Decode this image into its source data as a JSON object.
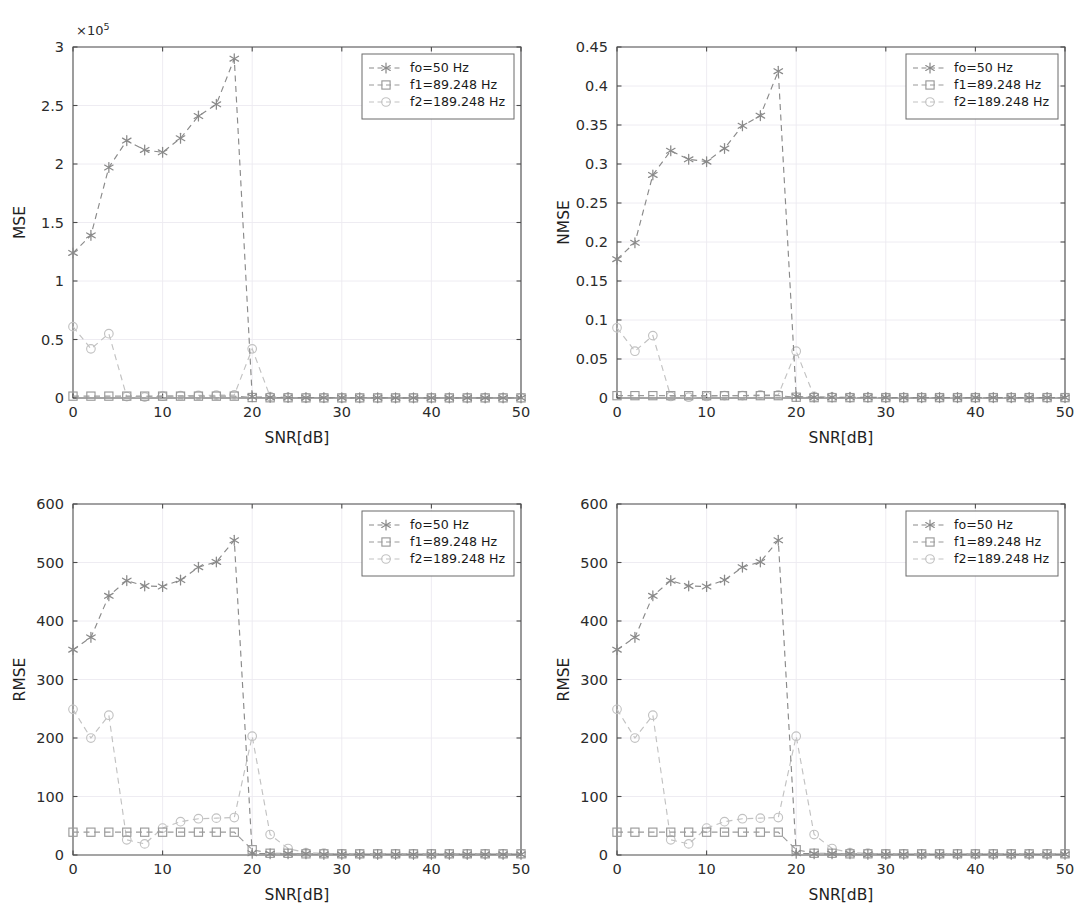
{
  "figure": {
    "background": "#ffffff",
    "xlabel": "SNR[dB]",
    "panel_count": 4
  },
  "legend": {
    "entries": [
      {
        "label": "fo=50 Hz",
        "marker": "star",
        "color": "#8a8a8a"
      },
      {
        "label": "f1=89.248 Hz",
        "marker": "square",
        "color": "#9a9a9a"
      },
      {
        "label": "f2=189.248 Hz",
        "marker": "circle",
        "color": "#c2c2c2"
      }
    ]
  },
  "chart_data": [
    {
      "id": "panel-mse-top-left",
      "type": "line",
      "title": "",
      "xlabel": "SNR[dB]",
      "ylabel": "MSE",
      "xlim": [
        0,
        50
      ],
      "ylim": [
        0,
        3
      ],
      "xticks": [
        0,
        10,
        20,
        30,
        40,
        50
      ],
      "yticks": [
        0,
        0.5,
        1,
        1.5,
        2,
        2.5,
        3
      ],
      "ytick_labels": [
        "0",
        "0.5",
        "1",
        "1.5",
        "2",
        "2.5",
        "3"
      ],
      "y_offset_text": "×10",
      "y_offset_exponent": "5",
      "grid": true,
      "legend_position": "upper right",
      "x": [
        0,
        2,
        4,
        6,
        8,
        10,
        12,
        14,
        16,
        18,
        20,
        22,
        24,
        26,
        28,
        30,
        32,
        34,
        36,
        38,
        40,
        42,
        44,
        46,
        48,
        50
      ],
      "series": [
        {
          "name": "fo=50 Hz",
          "marker": "star",
          "color": "#8a8a8a",
          "values": [
            1.24,
            1.39,
            1.97,
            2.2,
            2.12,
            2.1,
            2.22,
            2.41,
            2.51,
            2.9,
            0.01,
            0.005,
            0.004,
            0.003,
            0.003,
            0.002,
            0.002,
            0.002,
            0.001,
            0.001,
            0.001,
            0.001,
            0.001,
            0.001,
            0.001,
            0.001
          ]
        },
        {
          "name": "f1=89.248 Hz",
          "marker": "square",
          "color": "#9a9a9a",
          "values": [
            0.016,
            0.016,
            0.016,
            0.016,
            0.016,
            0.016,
            0.016,
            0.016,
            0.016,
            0.016,
            0.004,
            0.002,
            0.002,
            0.001,
            0.001,
            0.001,
            0.001,
            0.001,
            0.001,
            0.001,
            0.001,
            0.001,
            0.001,
            0.001,
            0.001,
            0.001
          ]
        },
        {
          "name": "f2=189.248 Hz",
          "marker": "circle",
          "color": "#c2c2c2",
          "values": [
            0.61,
            0.42,
            0.55,
            0.012,
            0.008,
            0.016,
            0.02,
            0.022,
            0.024,
            0.026,
            0.42,
            0.012,
            0.005,
            0.002,
            0.001,
            0.001,
            0.001,
            0.001,
            0.001,
            0.001,
            0.001,
            0.001,
            0.001,
            0.001,
            0.001,
            0.001
          ]
        }
      ]
    },
    {
      "id": "panel-nmse-top-right",
      "type": "line",
      "title": "",
      "xlabel": "SNR[dB]",
      "ylabel": "NMSE",
      "xlim": [
        0,
        50
      ],
      "ylim": [
        0,
        0.45
      ],
      "xticks": [
        0,
        10,
        20,
        30,
        40,
        50
      ],
      "yticks": [
        0,
        0.05,
        0.1,
        0.15,
        0.2,
        0.25,
        0.3,
        0.35,
        0.4,
        0.45
      ],
      "ytick_labels": [
        "0",
        "0.05",
        "0.1",
        "0.15",
        "0.2",
        "0.25",
        "0.3",
        "0.35",
        "0.4",
        "0.45"
      ],
      "y_offset_text": "",
      "y_offset_exponent": "",
      "grid": true,
      "legend_position": "upper right",
      "x": [
        0,
        2,
        4,
        6,
        8,
        10,
        12,
        14,
        16,
        18,
        20,
        22,
        24,
        26,
        28,
        30,
        32,
        34,
        36,
        38,
        40,
        42,
        44,
        46,
        48,
        50
      ],
      "series": [
        {
          "name": "fo=50 Hz",
          "marker": "star",
          "color": "#8a8a8a",
          "values": [
            0.178,
            0.199,
            0.286,
            0.317,
            0.306,
            0.303,
            0.32,
            0.349,
            0.362,
            0.419,
            0.002,
            0.001,
            0.001,
            0.001,
            0.001,
            0.0005,
            0.0005,
            0.0005,
            0.0005,
            0.0005,
            0.0005,
            0.0005,
            0.0005,
            0.0005,
            0.0005,
            0.0005
          ]
        },
        {
          "name": "f1=89.248 Hz",
          "marker": "square",
          "color": "#9a9a9a",
          "values": [
            0.003,
            0.003,
            0.003,
            0.003,
            0.003,
            0.003,
            0.003,
            0.003,
            0.003,
            0.003,
            0.001,
            0.0005,
            0.0005,
            0.0005,
            0.0005,
            0.0005,
            0.0005,
            0.0005,
            0.0005,
            0.0005,
            0.0005,
            0.0005,
            0.0005,
            0.0005,
            0.0005,
            0.0005
          ]
        },
        {
          "name": "f2=189.248 Hz",
          "marker": "circle",
          "color": "#c2c2c2",
          "values": [
            0.09,
            0.06,
            0.08,
            0.002,
            0.001,
            0.002,
            0.003,
            0.003,
            0.004,
            0.004,
            0.06,
            0.002,
            0.001,
            0.0005,
            0.0005,
            0.0005,
            0.0005,
            0.0005,
            0.0005,
            0.0005,
            0.0005,
            0.0005,
            0.0005,
            0.0005,
            0.0005,
            0.0005
          ]
        }
      ]
    },
    {
      "id": "panel-rmse-bottom-left",
      "type": "line",
      "title": "",
      "xlabel": "SNR[dB]",
      "ylabel": "RMSE",
      "xlim": [
        0,
        50
      ],
      "ylim": [
        0,
        600
      ],
      "xticks": [
        0,
        10,
        20,
        30,
        40,
        50
      ],
      "yticks": [
        0,
        100,
        200,
        300,
        400,
        500,
        600
      ],
      "ytick_labels": [
        "0",
        "100",
        "200",
        "300",
        "400",
        "500",
        "600"
      ],
      "y_offset_text": "",
      "y_offset_exponent": "",
      "grid": true,
      "legend_position": "upper right",
      "x": [
        0,
        2,
        4,
        6,
        8,
        10,
        12,
        14,
        16,
        18,
        20,
        22,
        24,
        26,
        28,
        30,
        32,
        34,
        36,
        38,
        40,
        42,
        44,
        46,
        48,
        50
      ],
      "series": [
        {
          "name": "fo=50 Hz",
          "marker": "star",
          "color": "#8a8a8a",
          "values": [
            351,
            372,
            443,
            469,
            460,
            459,
            470,
            492,
            501,
            538,
            3,
            2,
            2,
            2,
            1,
            1,
            1,
            1,
            1,
            1,
            1,
            1,
            1,
            1,
            1,
            1
          ]
        },
        {
          "name": "f1=89.248 Hz",
          "marker": "square",
          "color": "#9a9a9a",
          "values": [
            39,
            39,
            39,
            39,
            39,
            39,
            39,
            39,
            39,
            39,
            9,
            3,
            3,
            2,
            2,
            2,
            2,
            2,
            2,
            2,
            2,
            2,
            2,
            2,
            2,
            2
          ]
        },
        {
          "name": "f2=189.248 Hz",
          "marker": "circle",
          "color": "#c2c2c2",
          "values": [
            249,
            200,
            239,
            26,
            19,
            46,
            57,
            62,
            63,
            64,
            203,
            35,
            11,
            4,
            3,
            2,
            2,
            2,
            2,
            2,
            2,
            2,
            2,
            2,
            2,
            2
          ]
        }
      ]
    },
    {
      "id": "panel-rmse-bottom-right",
      "type": "line",
      "title": "",
      "xlabel": "SNR[dB]",
      "ylabel": "RMSE",
      "xlim": [
        0,
        50
      ],
      "ylim": [
        0,
        600
      ],
      "xticks": [
        0,
        10,
        20,
        30,
        40,
        50
      ],
      "yticks": [
        0,
        100,
        200,
        300,
        400,
        500,
        600
      ],
      "ytick_labels": [
        "0",
        "100",
        "200",
        "300",
        "400",
        "500",
        "600"
      ],
      "y_offset_text": "",
      "y_offset_exponent": "",
      "grid": true,
      "legend_position": "upper right",
      "x": [
        0,
        2,
        4,
        6,
        8,
        10,
        12,
        14,
        16,
        18,
        20,
        22,
        24,
        26,
        28,
        30,
        32,
        34,
        36,
        38,
        40,
        42,
        44,
        46,
        48,
        50
      ],
      "series": [
        {
          "name": "fo=50 Hz",
          "marker": "star",
          "color": "#8a8a8a",
          "values": [
            351,
            372,
            443,
            469,
            460,
            459,
            470,
            492,
            501,
            538,
            3,
            2,
            2,
            2,
            1,
            1,
            1,
            1,
            1,
            1,
            1,
            1,
            1,
            1,
            1,
            1
          ]
        },
        {
          "name": "f1=89.248 Hz",
          "marker": "square",
          "color": "#9a9a9a",
          "values": [
            39,
            39,
            39,
            39,
            39,
            39,
            39,
            39,
            39,
            39,
            9,
            3,
            3,
            2,
            2,
            2,
            2,
            2,
            2,
            2,
            2,
            2,
            2,
            2,
            2,
            2
          ]
        },
        {
          "name": "f2=189.248 Hz",
          "marker": "circle",
          "color": "#c2c2c2",
          "values": [
            249,
            200,
            239,
            26,
            19,
            46,
            57,
            62,
            63,
            64,
            203,
            35,
            11,
            4,
            3,
            2,
            2,
            2,
            2,
            2,
            2,
            2,
            2,
            2,
            2,
            2
          ]
        }
      ]
    }
  ]
}
